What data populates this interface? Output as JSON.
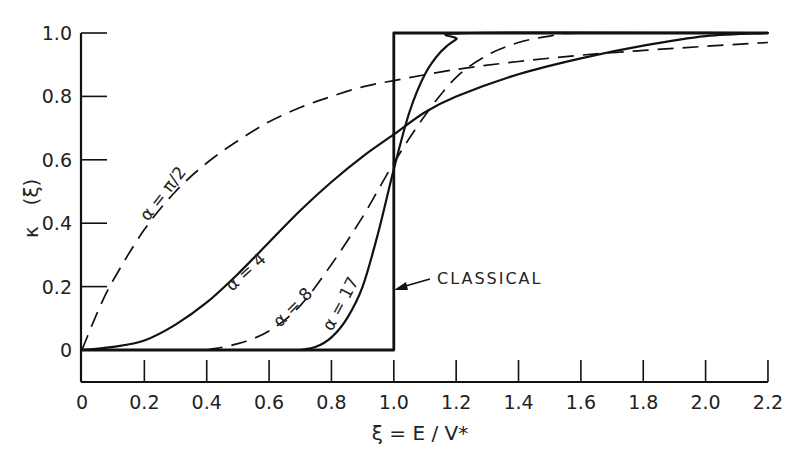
{
  "chart_data": {
    "type": "line",
    "title": "",
    "xlabel": "ξ = E / V*",
    "ylabel": "κ (ξ)",
    "xlim": [
      0,
      2.2
    ],
    "ylim": [
      0,
      1.0
    ],
    "grid": false,
    "legend": "inline curve labels",
    "x_ticks": [
      "0",
      "0.2",
      "0.4",
      "0.6",
      "0.8",
      "1.0",
      "1.2",
      "1.4",
      "1.6",
      "1.8",
      "2.0",
      "2.2"
    ],
    "y_ticks": [
      "0",
      "0.2",
      "0.4",
      "0.6",
      "0.8",
      "1.0"
    ],
    "series": [
      {
        "name": "α = π/2",
        "style": "dashed",
        "x": [
          0,
          0.05,
          0.1,
          0.2,
          0.3,
          0.4,
          0.5,
          0.6,
          0.7,
          0.8,
          0.9,
          1.0,
          1.2,
          1.4,
          1.6,
          1.8,
          2.0,
          2.2
        ],
        "y": [
          0,
          0.12,
          0.22,
          0.38,
          0.5,
          0.59,
          0.66,
          0.72,
          0.765,
          0.8,
          0.83,
          0.85,
          0.885,
          0.91,
          0.93,
          0.945,
          0.958,
          0.97
        ]
      },
      {
        "name": "α = 4",
        "style": "solid",
        "x": [
          0,
          0.1,
          0.2,
          0.3,
          0.4,
          0.5,
          0.6,
          0.7,
          0.8,
          0.9,
          1.0,
          1.1,
          1.2,
          1.4,
          1.6,
          1.8,
          2.0,
          2.2
        ],
        "y": [
          0,
          0.01,
          0.03,
          0.08,
          0.15,
          0.24,
          0.34,
          0.44,
          0.53,
          0.61,
          0.68,
          0.75,
          0.8,
          0.87,
          0.92,
          0.96,
          0.99,
          1.0
        ]
      },
      {
        "name": "α = 8",
        "style": "dashed",
        "x": [
          0.4,
          0.5,
          0.6,
          0.7,
          0.8,
          0.9,
          1.0,
          1.1,
          1.2,
          1.3,
          1.4,
          1.5,
          1.6,
          2.2
        ],
        "y": [
          0,
          0.02,
          0.06,
          0.14,
          0.27,
          0.42,
          0.59,
          0.74,
          0.86,
          0.93,
          0.97,
          0.99,
          1.0,
          1.0
        ]
      },
      {
        "name": "α = 17",
        "style": "solid",
        "x": [
          0.7,
          0.75,
          0.8,
          0.85,
          0.9,
          0.95,
          1.0,
          1.05,
          1.1,
          1.15,
          1.2,
          1.25,
          2.2
        ],
        "y": [
          0,
          0.01,
          0.04,
          0.1,
          0.2,
          0.37,
          0.57,
          0.75,
          0.87,
          0.94,
          0.98,
          1.0,
          1.0
        ]
      },
      {
        "name": "Classical",
        "style": "solid-heavy",
        "x": [
          0,
          1.0,
          1.0,
          2.2
        ],
        "y": [
          0,
          0,
          1.0,
          1.0
        ]
      }
    ],
    "annotations": [
      {
        "text": "α = π/2",
        "x": 0.3,
        "y": 0.42,
        "rotation": -52
      },
      {
        "text": "α = 4",
        "x": 0.48,
        "y": 0.2,
        "rotation": -40
      },
      {
        "text": "α = 8",
        "x": 0.66,
        "y": 0.08,
        "rotation": -45
      },
      {
        "text": "α = 17",
        "x": 0.82,
        "y": 0.05,
        "rotation": -62
      },
      {
        "text": "CLASSICAL",
        "x": 1.15,
        "y": 0.23,
        "arrow_to": [
          1.0,
          0.2
        ]
      }
    ]
  },
  "labels": {
    "xlabel": "ξ = E / V*",
    "ylabel_kappa": "κ",
    "ylabel_arg": "(ξ)",
    "classical": "CLASSICAL",
    "alpha_pi2": "α = π/2",
    "alpha_4": "α = 4",
    "alpha_8": "α = 8",
    "alpha_17": "α = 17"
  }
}
